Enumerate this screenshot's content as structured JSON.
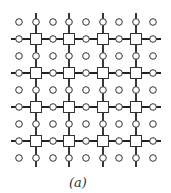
{
  "diagram": {
    "caption": "(a)",
    "grid": {
      "columns_x": [
        19,
        36,
        53,
        69,
        86,
        103,
        119,
        136,
        153
      ],
      "rows_y": [
        22,
        39,
        56,
        73,
        90,
        107,
        124,
        141,
        158
      ],
      "node_types": {
        "square": "rows and columns with odd index intersect (thick-line crossings)",
        "circle": "all other lattice points"
      },
      "thick_line_columns": [
        1,
        3,
        5,
        7
      ],
      "thick_line_rows": [
        1,
        3,
        5,
        7
      ],
      "line_extent": {
        "x_min": 11,
        "x_max": 161,
        "y_min": 13,
        "y_max": 167
      }
    },
    "colors": {
      "line": "#222222",
      "node_stroke": "#333333",
      "node_fill": "#ffffff"
    }
  }
}
